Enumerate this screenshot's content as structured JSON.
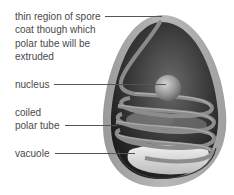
{
  "diagram": {
    "labels": [
      {
        "id": "thin-region",
        "lines": [
          "thin region of spore",
          "coat though which",
          "polar tube will be",
          "extruded"
        ]
      },
      {
        "id": "nucleus",
        "lines": [
          "nucleus"
        ]
      },
      {
        "id": "coiled-polar-tube",
        "lines": [
          "coiled",
          "polar tube"
        ]
      },
      {
        "id": "vacuole",
        "lines": [
          "vacuole"
        ]
      }
    ]
  },
  "colors": {
    "text": "#4a4a4a",
    "leader": "#555555",
    "coat": "#a8a8a8",
    "interior_dark": "#2a2a2a",
    "tube": "#8a8a8a",
    "vacuole": "#e6e6e6"
  }
}
